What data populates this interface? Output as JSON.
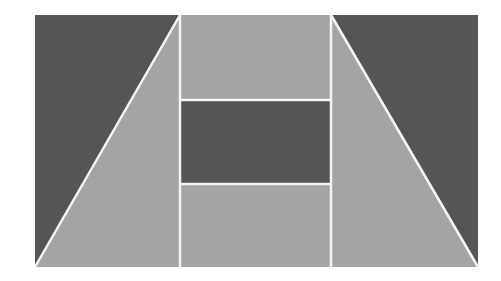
{
  "figure": {
    "colors": {
      "background": "#ffffff",
      "dark": "#555555",
      "light": "#a4a4a4",
      "separator": "#f4f4f4"
    },
    "outer_rect": {
      "x": 35,
      "y": 15,
      "width": 443,
      "height": 252
    },
    "pieces": [
      {
        "name": "top-left-dark-triangle",
        "fill": "dark",
        "points": "35,15 180,15 35,267"
      },
      {
        "name": "left-light-trapezoid",
        "fill": "light",
        "points": "180,15 180,267 35,267"
      },
      {
        "name": "center-top-light-band",
        "fill": "light",
        "points": "180,15 331,15 331,100 180,100"
      },
      {
        "name": "center-middle-dark-band",
        "fill": "dark",
        "points": "180,100 331,100 331,184 180,184"
      },
      {
        "name": "center-bottom-light-band",
        "fill": "light",
        "points": "180,184 331,184 331,267 180,267"
      },
      {
        "name": "right-light-trapezoid",
        "fill": "light",
        "points": "331,15 478,267 331,267"
      },
      {
        "name": "top-right-dark-triangle",
        "fill": "dark",
        "points": "331,15 478,15 478,267"
      }
    ],
    "separators": [
      {
        "name": "left-diagonal-line",
        "x1": 180,
        "y1": 15,
        "x2": 35,
        "y2": 267
      },
      {
        "name": "left-vertical-line",
        "x1": 180,
        "y1": 15,
        "x2": 180,
        "y2": 267
      },
      {
        "name": "right-vertical-line",
        "x1": 331,
        "y1": 15,
        "x2": 331,
        "y2": 267
      },
      {
        "name": "right-diagonal-line",
        "x1": 331,
        "y1": 15,
        "x2": 478,
        "y2": 267
      },
      {
        "name": "upper-horizontal-line",
        "x1": 180,
        "y1": 100,
        "x2": 331,
        "y2": 100
      },
      {
        "name": "lower-horizontal-line",
        "x1": 180,
        "y1": 184,
        "x2": 331,
        "y2": 184
      }
    ]
  }
}
